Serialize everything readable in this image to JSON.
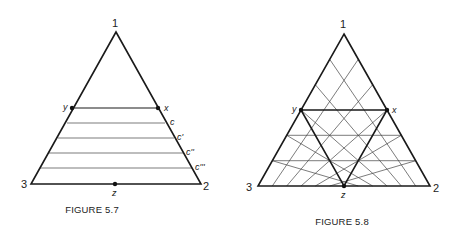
{
  "figures": [
    {
      "caption": "FIGURE 5.7",
      "vertices": {
        "top": "1",
        "bottom_right": "2",
        "bottom_left": "3"
      },
      "points": {
        "x": "x",
        "y": "y",
        "z": "z"
      },
      "level_labels": [
        "c",
        "c'",
        "c''",
        "c'''"
      ],
      "description": "Triangle with horizontal line segment y–x and four parallel lines below labeled c, c', c'', c'''; point z at middle of base"
    },
    {
      "caption": "FIGURE 5.8",
      "vertices": {
        "top": "1",
        "bottom_right": "2",
        "bottom_left": "3"
      },
      "points": {
        "x": "x",
        "y": "y",
        "z": "z"
      },
      "grid_divisions": 6,
      "description": "Triangle subdivided by a triangular grid; bold inner triangle x–y–z with z at base midpoint"
    }
  ]
}
